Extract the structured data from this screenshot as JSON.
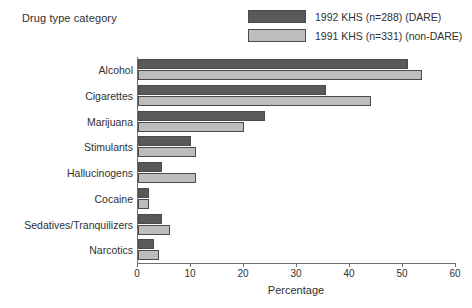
{
  "chart_title": "Drug type category",
  "legend": {
    "items": [
      {
        "label": "1992 KHS (n=288) (DARE)",
        "color": "#595959",
        "name": "dare"
      },
      {
        "label": "1991 KHS (n=331) (non-DARE)",
        "color": "#bdbdbd",
        "name": "non-dare"
      }
    ]
  },
  "chart_data": {
    "type": "bar",
    "orientation": "horizontal",
    "title": "Drug type category",
    "xlabel": "Percentage",
    "ylabel": "",
    "xlim": [
      0,
      60
    ],
    "xticks": [
      0,
      10,
      20,
      30,
      40,
      50,
      60
    ],
    "grid": false,
    "legend_position": "top-right",
    "categories": [
      "Alcohol",
      "Cigarettes",
      "Marijuana",
      "Stimulants",
      "Hallucinogens",
      "Cocaine",
      "Sedatives/Tranquilizers",
      "Narcotics"
    ],
    "series": [
      {
        "name": "1992 KHS (n=288) (DARE)",
        "color": "#595959",
        "values": [
          51,
          35.5,
          24,
          10,
          4.5,
          2,
          4.5,
          3
        ]
      },
      {
        "name": "1991 KHS (n=331) (non-DARE)",
        "color": "#bdbdbd",
        "values": [
          53.5,
          44,
          20,
          11,
          11,
          2,
          6,
          4
        ]
      }
    ]
  }
}
